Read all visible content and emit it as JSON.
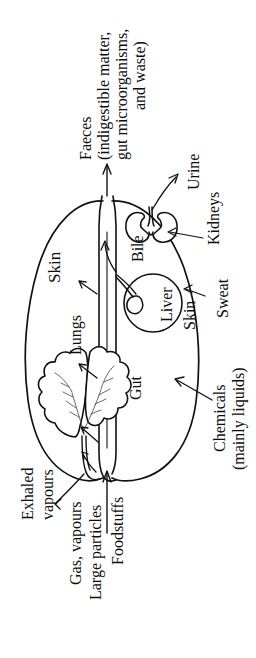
{
  "figure": {
    "orientation_note": "all text rotated 90 degrees counter-clockwise",
    "stroke_color": "#111111",
    "background_color": "#ffffff"
  },
  "labels": {
    "faeces_line1": "Faeces",
    "faeces_line2": "(indigestible matter,",
    "faeces_line3": "gut microorganisms,",
    "faeces_line4": "and waste)",
    "urine": "Urine",
    "kidneys": "Kidneys",
    "bile": "Bile",
    "liver": "Liver",
    "skin_left": "Skin",
    "skin_right": "Skin",
    "sweat": "Sweat",
    "lungs": "Lungs",
    "gut": "Gut",
    "chemicals_line1": "Chemicals",
    "chemicals_line2": "(mainly liquids)",
    "exhaled_line1": "Exhaled",
    "exhaled_line2": "vapours",
    "gas_vapours": "Gas, vapours",
    "large_particles": "Large particles",
    "foodstuffs": "Foodstuffs"
  },
  "organs": [
    {
      "name": "lungs",
      "label": "Lungs"
    },
    {
      "name": "liver",
      "label": "Liver"
    },
    {
      "name": "gallbladder",
      "label": "Bile"
    },
    {
      "name": "kidneys",
      "label": "Kidneys"
    },
    {
      "name": "gut",
      "label": "Gut"
    },
    {
      "name": "skin",
      "label": "Skin"
    }
  ],
  "flows": {
    "inputs": [
      "Gas, vapours",
      "Large particles",
      "Foodstuffs",
      "Chemicals (mainly liquids)"
    ],
    "outputs": [
      "Exhaled vapours",
      "Faeces (indigestible matter, gut microorganisms, and waste)",
      "Urine",
      "Sweat"
    ]
  }
}
